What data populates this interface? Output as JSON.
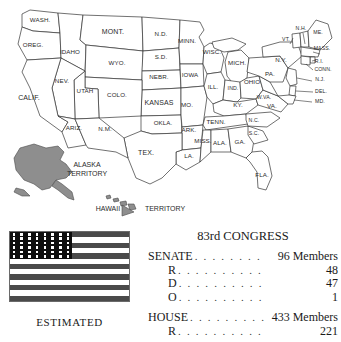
{
  "map": {
    "name": "united-states-map-1953",
    "states": [
      {
        "abbr": "WASH.",
        "x": 40,
        "y": 22
      },
      {
        "abbr": "OREG.",
        "x": 33,
        "y": 47
      },
      {
        "abbr": "IDAHO",
        "x": 70,
        "y": 54
      },
      {
        "abbr": "MONT.",
        "x": 113,
        "y": 34
      },
      {
        "abbr": "N.D.",
        "x": 161,
        "y": 36
      },
      {
        "abbr": "MINN.",
        "x": 187,
        "y": 43
      },
      {
        "abbr": "S.D.",
        "x": 161,
        "y": 59
      },
      {
        "abbr": "WYO.",
        "x": 117,
        "y": 65
      },
      {
        "abbr": "NEBR.",
        "x": 159,
        "y": 79
      },
      {
        "abbr": "IOWA",
        "x": 190,
        "y": 77
      },
      {
        "abbr": "WISC.",
        "x": 212,
        "y": 54
      },
      {
        "abbr": "MICH.",
        "x": 237,
        "y": 65
      },
      {
        "abbr": "NEV.",
        "x": 62,
        "y": 83
      },
      {
        "abbr": "UTAH",
        "x": 85,
        "y": 93
      },
      {
        "abbr": "COLO.",
        "x": 117,
        "y": 97
      },
      {
        "abbr": "KANSAS",
        "x": 159,
        "y": 105
      },
      {
        "abbr": "MO.",
        "x": 187,
        "y": 107
      },
      {
        "abbr": "ILL.",
        "x": 213,
        "y": 89
      },
      {
        "abbr": "IND.",
        "x": 233,
        "y": 90
      },
      {
        "abbr": "OHIO",
        "x": 252,
        "y": 84
      },
      {
        "abbr": "KY.",
        "x": 238,
        "y": 107
      },
      {
        "abbr": "CALIF.",
        "x": 29,
        "y": 100
      },
      {
        "abbr": "ARIZ.",
        "x": 74,
        "y": 130
      },
      {
        "abbr": "N.M.",
        "x": 105,
        "y": 131
      },
      {
        "abbr": "OKLA.",
        "x": 163,
        "y": 125
      },
      {
        "abbr": "ARK.",
        "x": 189,
        "y": 132
      },
      {
        "abbr": "TEX.",
        "x": 146,
        "y": 155
      },
      {
        "abbr": "LA.",
        "x": 189,
        "y": 158
      },
      {
        "abbr": "MISS.",
        "x": 203,
        "y": 143
      },
      {
        "abbr": "ALA.",
        "x": 220,
        "y": 145
      },
      {
        "abbr": "TENN.",
        "x": 216,
        "y": 124
      },
      {
        "abbr": "GA.",
        "x": 240,
        "y": 144
      },
      {
        "abbr": "N.C.",
        "x": 254,
        "y": 122
      },
      {
        "abbr": "S.C.",
        "x": 254,
        "y": 135
      },
      {
        "abbr": "FLA.",
        "x": 262,
        "y": 177
      },
      {
        "abbr": "W.VA.",
        "x": 264,
        "y": 99
      },
      {
        "abbr": "VA.",
        "x": 272,
        "y": 108
      },
      {
        "abbr": "PA.",
        "x": 270,
        "y": 76
      },
      {
        "abbr": "N.Y.",
        "x": 281,
        "y": 62
      },
      {
        "abbr": "VT.",
        "x": 286,
        "y": 41
      },
      {
        "abbr": "N.H.",
        "x": 301,
        "y": 30
      },
      {
        "abbr": "ME.",
        "x": 318,
        "y": 34
      },
      {
        "abbr": "MASS.",
        "x": 322,
        "y": 50
      },
      {
        "abbr": "R.I.",
        "x": 319,
        "y": 63
      },
      {
        "abbr": "CONN.",
        "x": 323,
        "y": 71
      },
      {
        "abbr": "N.J.",
        "x": 320,
        "y": 81
      },
      {
        "abbr": "DEL.",
        "x": 321,
        "y": 93
      },
      {
        "abbr": "MD.",
        "x": 320,
        "y": 103
      }
    ],
    "territories": [
      {
        "label_line1": "ALASKA",
        "label_line2": "TERRITORY",
        "x": 87,
        "y": 167
      },
      {
        "label_line1": "HAWAII",
        "label_line2": "TERRITORY",
        "x": 140,
        "y": 208
      }
    ]
  },
  "flag": {
    "name": "us-flag-48-star",
    "stars": 48,
    "star_rows": 6,
    "star_columns": 8,
    "stripes": 13,
    "caption": "ESTIMATED"
  },
  "congress": {
    "title": "83rd CONGRESS",
    "senate": {
      "label": "SENATE",
      "total_value": "96 Members",
      "rows": [
        {
          "label": "R",
          "value": "48"
        },
        {
          "label": "D",
          "value": "47"
        },
        {
          "label": "O",
          "value": "1"
        }
      ]
    },
    "house": {
      "label": "HOUSE",
      "total_value": "433 Members",
      "rows": [
        {
          "label": "R",
          "value": "221"
        }
      ]
    },
    "dots": ". . . . . . . . . . . . . . . . . . . ."
  },
  "colors": {
    "background": "#ffffff",
    "state_outline": "#333333",
    "state_fill": "#ffffff",
    "territory_fill": "#8e8e8e",
    "flag_stripe": "#4a4a4a",
    "flag_canton": "#0e0e0e",
    "text": "#1a1a1a"
  }
}
